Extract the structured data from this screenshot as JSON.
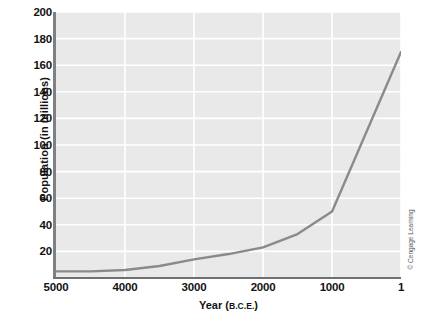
{
  "chart_data": {
    "type": "line",
    "title": "",
    "xlabel": "Year (B.C.E.)",
    "ylabel": "Population (in millions)",
    "xlabel_main": "Year (",
    "xlabel_smallcaps": "B.C.E.",
    "xlabel_tail": ")",
    "xtick_labels": [
      "5000",
      "4000",
      "3000",
      "2000",
      "1000",
      "1"
    ],
    "xtick_values": [
      5000,
      4000,
      3000,
      2000,
      1000,
      1
    ],
    "ytick_labels": [
      "20",
      "40",
      "60",
      "80",
      "100",
      "120",
      "140",
      "160",
      "180",
      "200"
    ],
    "ytick_values": [
      20,
      40,
      60,
      80,
      100,
      120,
      140,
      160,
      180,
      200
    ],
    "xlim": [
      5000,
      1
    ],
    "ylim": [
      0,
      200
    ],
    "x_axis_direction": "reversed",
    "grid": true,
    "grid_color": "#ffffff",
    "plot_background": "#e9e9e9",
    "line_color": "#8a8a8a",
    "legend": "none",
    "x": [
      5000,
      4500,
      4000,
      3500,
      3000,
      2500,
      2000,
      1500,
      1000,
      1
    ],
    "values": [
      5,
      5,
      6,
      9,
      14,
      18,
      23,
      33,
      50,
      170
    ],
    "series": [
      {
        "name": "World population",
        "x": [
          5000,
          4500,
          4000,
          3500,
          3000,
          2500,
          2000,
          1500,
          1000,
          1
        ],
        "values": [
          5,
          5,
          6,
          9,
          14,
          18,
          23,
          33,
          50,
          170
        ]
      }
    ],
    "annotations": []
  },
  "credit": "© Cengage Learning"
}
